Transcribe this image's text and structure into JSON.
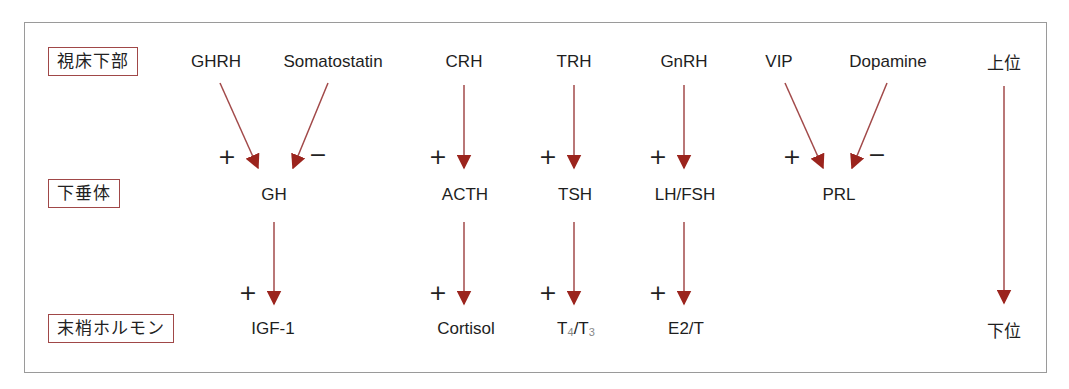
{
  "diagram": {
    "levels": [
      {
        "label": "視床下部"
      },
      {
        "label": "下垂体"
      },
      {
        "label": "末梢ホルモン"
      }
    ],
    "hierarchy": {
      "top": "上位",
      "bottom": "下位"
    },
    "colors": {
      "arrow_shaft": "#a24a4a",
      "arrow_head": "#9b241d",
      "label_border": "#a04848",
      "frame": "#9a9a9a"
    },
    "hypothalamus": {
      "ghrh": "GHRH",
      "somatostatin": "Somatostatin",
      "crh": "CRH",
      "trh": "TRH",
      "gnrh": "GnRH",
      "vip": "VIP",
      "dopamine": "Dopamine"
    },
    "pituitary": {
      "gh": "GH",
      "acth": "ACTH",
      "tsh": "TSH",
      "lhfsh": "LH/FSH",
      "prl": "PRL"
    },
    "peripheral": {
      "igf1": "IGF-1",
      "cortisol": "Cortisol",
      "t4t3": {
        "t": "T",
        "sub4": "4",
        "slash": "/",
        "sub3": "3"
      },
      "e2t": "E2/T"
    },
    "signs": {
      "plus": "+",
      "minus": "−"
    },
    "edges": [
      {
        "from": "GHRH",
        "to": "GH",
        "effect": "+"
      },
      {
        "from": "Somatostatin",
        "to": "GH",
        "effect": "−"
      },
      {
        "from": "CRH",
        "to": "ACTH",
        "effect": "+"
      },
      {
        "from": "TRH",
        "to": "TSH",
        "effect": "+"
      },
      {
        "from": "GnRH",
        "to": "LH/FSH",
        "effect": "+"
      },
      {
        "from": "VIP",
        "to": "PRL",
        "effect": "+"
      },
      {
        "from": "Dopamine",
        "to": "PRL",
        "effect": "−"
      },
      {
        "from": "GH",
        "to": "IGF-1",
        "effect": "+"
      },
      {
        "from": "ACTH",
        "to": "Cortisol",
        "effect": "+"
      },
      {
        "from": "TSH",
        "to": "T4/T3",
        "effect": "+"
      },
      {
        "from": "LH/FSH",
        "to": "E2/T",
        "effect": "+"
      }
    ]
  }
}
